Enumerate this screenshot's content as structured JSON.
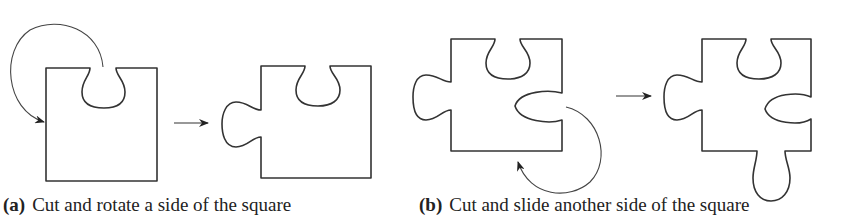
{
  "figure": {
    "panels": [
      {
        "id": "a",
        "label": "(a)",
        "caption": "Cut and rotate a side of the square"
      },
      {
        "id": "b",
        "label": "(b)",
        "caption": "Cut and slide another side of the square"
      }
    ],
    "colors": {
      "stroke": "#333333",
      "background": "#ffffff"
    }
  }
}
